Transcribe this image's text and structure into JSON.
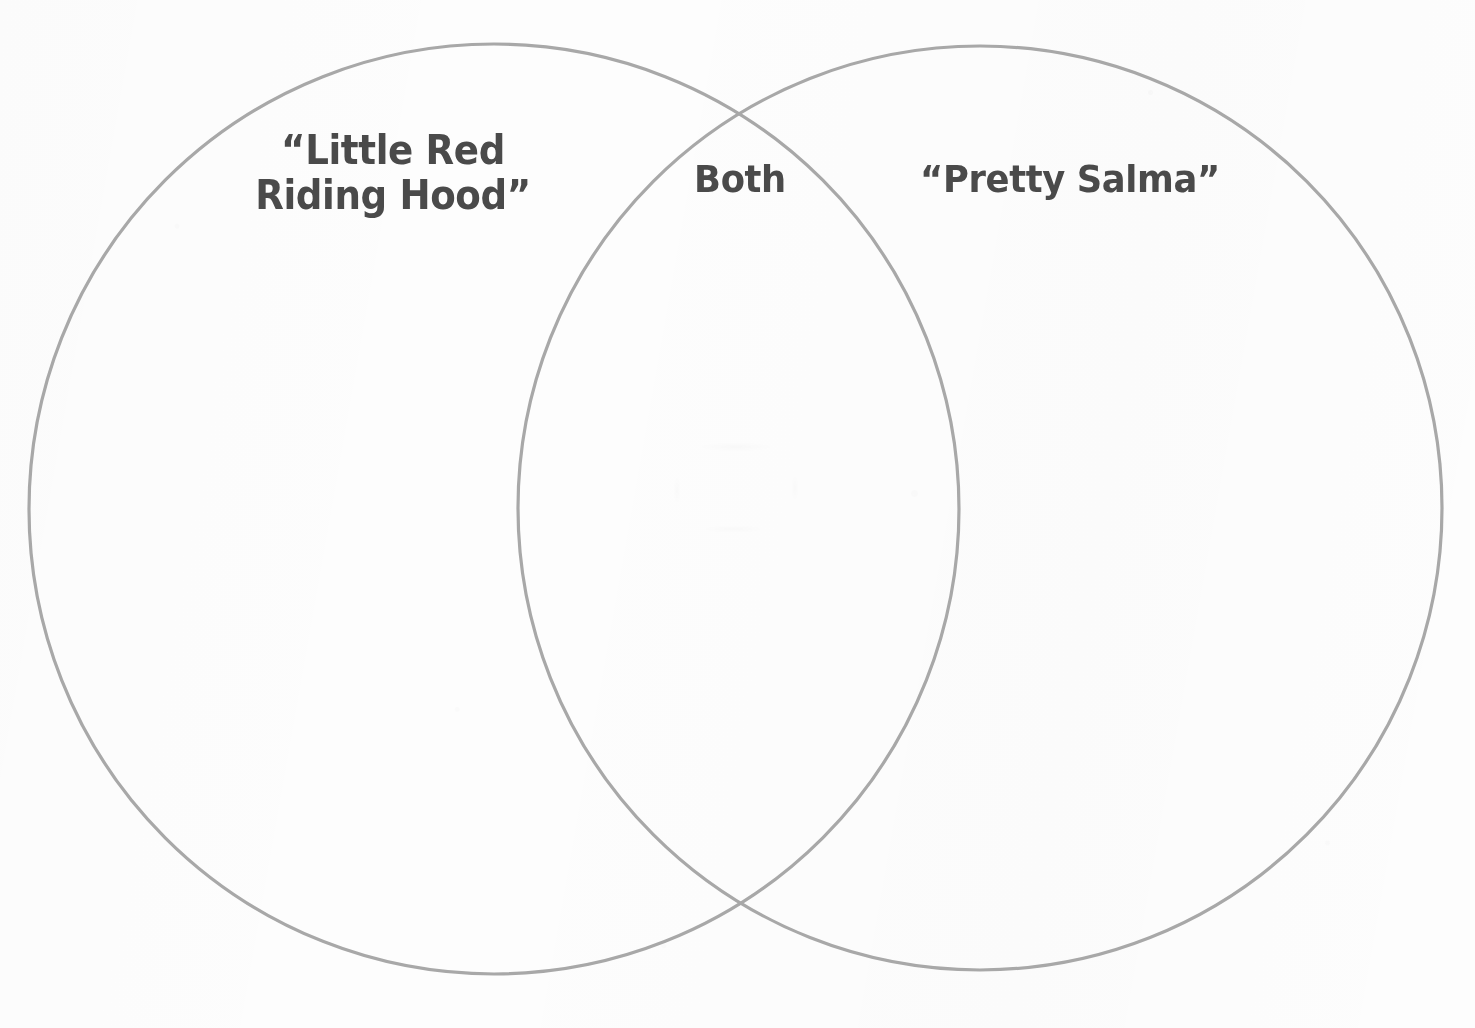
{
  "document": {
    "type": "venn-diagram-worksheet",
    "title": "Venn Diagram",
    "background_color": "#fdfdfd"
  },
  "diagram": {
    "kind": "venn",
    "set_count": 2,
    "stroke_color": "#a8a8a8",
    "stroke_width": 3,
    "fill": "none",
    "text_color": "#4a4a4a",
    "circles": [
      {
        "id": "left-circle",
        "label_key": "left",
        "cx": 494,
        "cy": 509,
        "r": 465
      },
      {
        "id": "right-circle",
        "label_key": "right",
        "cx": 980,
        "cy": 508,
        "r": 462
      }
    ],
    "intersections": [
      {
        "x": 737,
        "y": 103
      },
      {
        "x": 740,
        "y": 913
      }
    ],
    "regions": [
      {
        "id": "left-only",
        "label": "“Little Red\nRiding Hood”",
        "label_plain": "“Little Red Riding Hood”",
        "entries": []
      },
      {
        "id": "intersection",
        "label": "Both",
        "label_plain": "Both",
        "entries": []
      },
      {
        "id": "right-only",
        "label": "“Pretty Salma”",
        "label_plain": "“Pretty Salma”",
        "entries": []
      }
    ]
  },
  "labels": {
    "left": "“Little Red\nRiding Hood”",
    "both": "Both",
    "right": "“Pretty Salma”"
  }
}
